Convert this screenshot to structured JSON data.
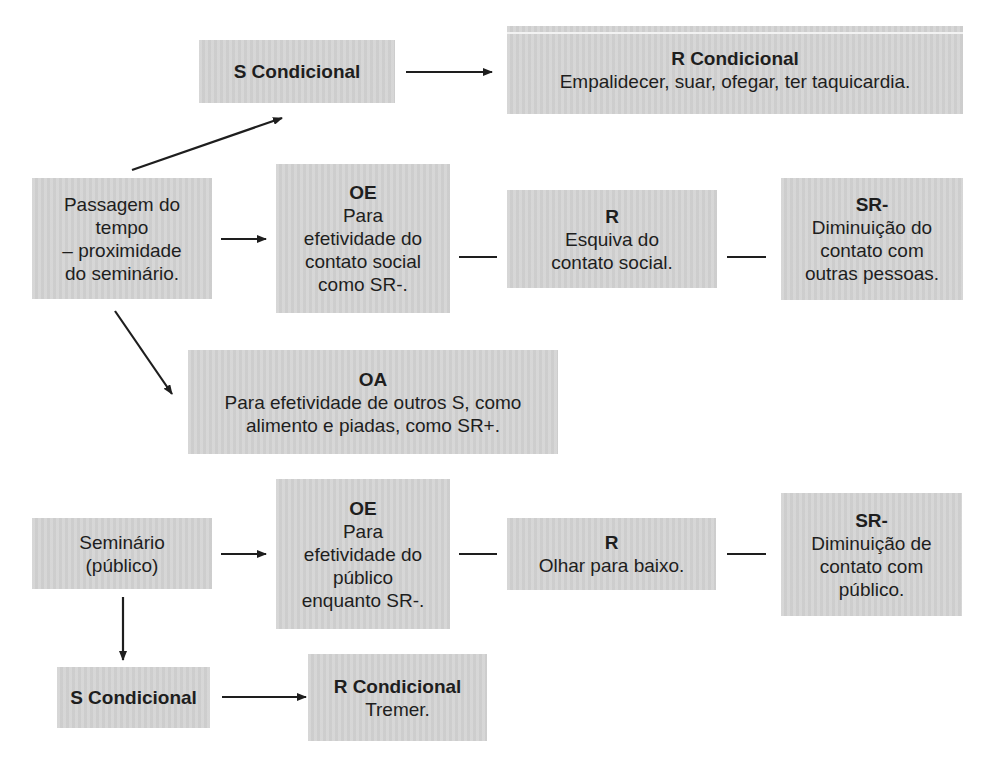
{
  "diagram": {
    "nodes": {
      "s_cond_top": {
        "title": "S Condicional",
        "body": ""
      },
      "r_cond_top": {
        "title": "R Condicional",
        "body": "Empalidecer, suar, ofegar, ter taquicardia."
      },
      "passagem": {
        "title": "",
        "body": "Passagem do\ntempo\n– proximidade\ndo seminário."
      },
      "oe_top": {
        "title": "OE",
        "body": "Para\nefetividade do\ncontato social\ncomo SR-."
      },
      "r_esquiva": {
        "title": "R",
        "body": "Esquiva do\ncontato social."
      },
      "sr_top": {
        "title": "SR-",
        "body": "Diminuição do\ncontato com\noutras pessoas."
      },
      "oa": {
        "title": "OA",
        "body": "Para efetividade de outros S, como\nalimento e piadas, como SR+."
      },
      "seminario": {
        "title": "",
        "body": "Seminário\n(público)"
      },
      "oe_bottom": {
        "title": "OE",
        "body": "Para\nefetividade do\npúblico\nenquanto SR-."
      },
      "r_olhar": {
        "title": "R",
        "body": "Olhar para baixo."
      },
      "sr_bottom": {
        "title": "SR-",
        "body": "Diminuição de\ncontato com\npúblico."
      },
      "s_cond_bottom": {
        "title": "S Condicional",
        "body": ""
      },
      "r_cond_bottom": {
        "title": "R Condicional",
        "body": "Tremer."
      }
    },
    "edges": [
      {
        "from": "passagem",
        "to": "s_cond_top",
        "type": "arrow"
      },
      {
        "from": "s_cond_top",
        "to": "r_cond_top",
        "type": "arrow"
      },
      {
        "from": "passagem",
        "to": "oe_top",
        "type": "arrow"
      },
      {
        "from": "oe_top",
        "to": "r_esquiva",
        "type": "line"
      },
      {
        "from": "r_esquiva",
        "to": "sr_top",
        "type": "line"
      },
      {
        "from": "passagem",
        "to": "oa",
        "type": "arrow"
      },
      {
        "from": "seminario",
        "to": "oe_bottom",
        "type": "arrow"
      },
      {
        "from": "oe_bottom",
        "to": "r_olhar",
        "type": "line"
      },
      {
        "from": "r_olhar",
        "to": "sr_bottom",
        "type": "line"
      },
      {
        "from": "seminario",
        "to": "s_cond_bottom",
        "type": "arrow"
      },
      {
        "from": "s_cond_bottom",
        "to": "r_cond_bottom",
        "type": "arrow"
      }
    ],
    "colors": {
      "box_fill": "#d4d4d4",
      "line": "#1e1e1e",
      "text": "#1e1e1e"
    }
  }
}
